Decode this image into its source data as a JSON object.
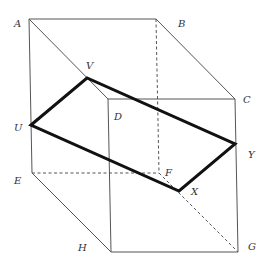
{
  "diagram": {
    "type": "cuboid-cross-section",
    "vertices": {
      "A": {
        "x": 29,
        "y": 19,
        "label_x": 14,
        "label_y": 27
      },
      "B": {
        "x": 156,
        "y": 19,
        "label_x": 178,
        "label_y": 27
      },
      "C": {
        "x": 235,
        "y": 99,
        "label_x": 243,
        "label_y": 103
      },
      "D": {
        "x": 108,
        "y": 99,
        "label_x": 114,
        "label_y": 120
      },
      "E": {
        "x": 32,
        "y": 173,
        "label_x": 14,
        "label_y": 184
      },
      "F": {
        "x": 159,
        "y": 173,
        "label_x": 165,
        "label_y": 176
      },
      "G": {
        "x": 238,
        "y": 252,
        "label_x": 248,
        "label_y": 250
      },
      "H": {
        "x": 111,
        "y": 252,
        "label_x": 78,
        "label_y": 251
      },
      "U": {
        "x": 31,
        "y": 125,
        "label_x": 14,
        "label_y": 131
      },
      "V": {
        "x": 87,
        "y": 78,
        "label_x": 86,
        "label_y": 69
      },
      "X": {
        "x": 179,
        "y": 191,
        "label_x": 191,
        "label_y": 195
      },
      "Y": {
        "x": 235,
        "y": 144,
        "label_x": 248,
        "label_y": 158
      }
    },
    "labels": {
      "A": "A",
      "B": "B",
      "C": "C",
      "D": "D",
      "E": "E",
      "F": "F",
      "G": "G",
      "H": "H",
      "U": "U",
      "V": "V",
      "X": "X",
      "Y": "Y"
    },
    "solid_edges": [
      [
        "A",
        "B"
      ],
      [
        "A",
        "E"
      ],
      [
        "A",
        "D"
      ],
      [
        "B",
        "C"
      ],
      [
        "D",
        "C"
      ],
      [
        "C",
        "G"
      ],
      [
        "D",
        "H"
      ],
      [
        "E",
        "H"
      ],
      [
        "H",
        "G"
      ]
    ],
    "hidden_edges": [
      [
        "B",
        "F"
      ],
      [
        "E",
        "F"
      ],
      [
        "F",
        "G"
      ]
    ],
    "cross_section": [
      "U",
      "V",
      "Y",
      "X"
    ],
    "colors": {
      "edge": "#555555",
      "section": "#111111",
      "label": "#333333"
    }
  }
}
